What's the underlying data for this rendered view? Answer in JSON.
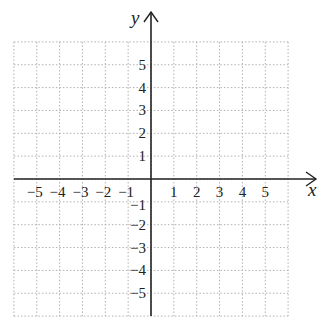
{
  "chart_data": {
    "type": "scatter",
    "title": "",
    "xlabel": "x",
    "ylabel": "y",
    "xlim": [
      -6,
      6
    ],
    "ylim": [
      -6,
      6
    ],
    "grid": true,
    "grid_style": "dotted",
    "x_ticks": [
      "-5",
      "-4",
      "-3",
      "-2",
      "-1",
      "1",
      "2",
      "3",
      "4",
      "5"
    ],
    "y_ticks": [
      "5",
      "4",
      "3",
      "2",
      "1",
      "-1",
      "-2",
      "-3",
      "-4",
      "-5"
    ],
    "x": [],
    "y": [],
    "colors": {
      "axis": "#222222",
      "grid": "#b0b0b0"
    }
  }
}
